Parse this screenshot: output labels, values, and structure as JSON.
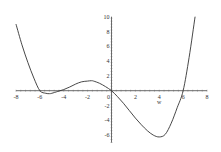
{
  "chart_data": {
    "type": "line",
    "title": "",
    "xlabel": "w",
    "ylabel": "",
    "xlim": [
      -8,
      8
    ],
    "ylim": [
      -7,
      10
    ],
    "grid": false,
    "legend": null,
    "x_ticks": [
      -8,
      -6,
      -4,
      -2,
      0,
      2,
      4,
      6,
      8
    ],
    "y_ticks": [
      -6,
      -4,
      -2,
      2,
      4,
      6,
      8,
      10
    ],
    "x_tick_labels": [
      "-8",
      "-6",
      "-4",
      "-2",
      "0",
      "2",
      "4",
      "6",
      "8"
    ],
    "y_tick_labels": [
      "-6",
      "-4",
      "-2",
      "2",
      "4",
      "6",
      "8",
      "10"
    ],
    "series": [
      {
        "name": "f(w)",
        "color": "#333333",
        "x": [
          -8,
          -7.5,
          -7,
          -6.5,
          -6,
          -5.5,
          -5.2,
          -5,
          -4.5,
          -4,
          -3.5,
          -3,
          -2.5,
          -2,
          -1.7,
          -1.5,
          -1,
          -0.5,
          0,
          0.5,
          1,
          1.5,
          2,
          2.5,
          3,
          3.5,
          4,
          4.5,
          5,
          5.5,
          6,
          6.5,
          7
        ],
        "y": [
          9,
          6.2,
          3.8,
          1.7,
          0,
          -0.35,
          -0.4,
          -0.35,
          -0.1,
          0.15,
          0.5,
          0.9,
          1.2,
          1.3,
          1.35,
          1.3,
          1.0,
          0.55,
          0,
          -0.8,
          -1.7,
          -2.7,
          -3.7,
          -4.6,
          -5.4,
          -6.0,
          -6.25,
          -5.9,
          -4.4,
          -2.3,
          0,
          4.5,
          10
        ]
      }
    ],
    "annotations": []
  }
}
